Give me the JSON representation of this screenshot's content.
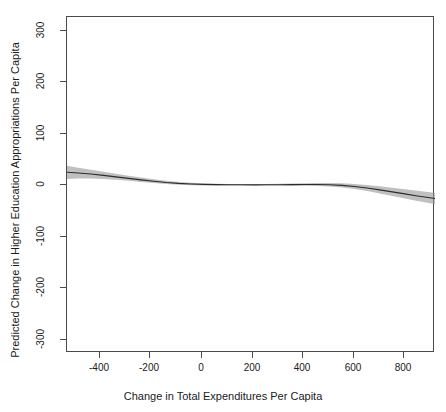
{
  "chart_data": {
    "type": "line",
    "title": "",
    "xlabel": "Change in Total Expenditures Per Capita",
    "ylabel": "Predicted Change in Higher Education Appropriations Per Capita",
    "xlim": [
      -545,
      920
    ],
    "ylim": [
      -330,
      330
    ],
    "xticks": [
      -400,
      -200,
      0,
      200,
      400,
      600,
      800
    ],
    "xtick_labels": [
      "-400",
      "-200",
      "0",
      "200",
      "400",
      "600",
      "800"
    ],
    "yticks": [
      -300,
      -200,
      -100,
      0,
      100,
      200,
      300
    ],
    "ytick_labels": [
      "-300",
      "-200",
      "-100",
      "0",
      "100",
      "200",
      "300"
    ],
    "grid": false,
    "legend": null,
    "series": [
      {
        "name": "Predicted change (fitted)",
        "type": "line",
        "color": "#2b2b2b",
        "x": [
          -545,
          -500,
          -450,
          -400,
          -350,
          -300,
          -250,
          -200,
          -150,
          -100,
          -50,
          0,
          50,
          100,
          150,
          200,
          250,
          300,
          350,
          400,
          450,
          500,
          550,
          600,
          650,
          700,
          750,
          800,
          850,
          900,
          920
        ],
        "y": [
          25,
          23.5,
          21.5,
          19,
          16,
          13,
          10,
          7.5,
          5,
          3.2,
          2,
          1.2,
          0.8,
          0.5,
          0.4,
          0.3,
          0.4,
          0.6,
          0.8,
          1.0,
          1.0,
          0.5,
          -0.8,
          -3.0,
          -6.0,
          -9.5,
          -13.5,
          -17.5,
          -21.5,
          -25.0,
          -26.5
        ]
      },
      {
        "name": "Confidence band (upper)",
        "type": "band-upper",
        "color": "#9a9a9a",
        "x": [
          -545,
          -500,
          -450,
          -400,
          -350,
          -300,
          -250,
          -200,
          -150,
          -100,
          -50,
          0,
          50,
          100,
          150,
          200,
          250,
          300,
          350,
          400,
          450,
          500,
          550,
          600,
          650,
          700,
          750,
          800,
          850,
          900,
          920
        ],
        "y": [
          38,
          34,
          30,
          26,
          22,
          18,
          14.5,
          11.5,
          8.5,
          6.0,
          4.2,
          3.0,
          2.4,
          2.0,
          1.8,
          1.8,
          2.0,
          2.4,
          3.0,
          3.6,
          4.0,
          4.0,
          3.4,
          2.0,
          0.0,
          -2.5,
          -5.5,
          -8.5,
          -11.5,
          -14.0,
          -15.0
        ]
      },
      {
        "name": "Confidence band (lower)",
        "type": "band-lower",
        "color": "#9a9a9a",
        "x": [
          -545,
          -500,
          -450,
          -400,
          -350,
          -300,
          -250,
          -200,
          -150,
          -100,
          -50,
          0,
          50,
          100,
          150,
          200,
          250,
          300,
          350,
          400,
          450,
          500,
          550,
          600,
          650,
          700,
          750,
          800,
          850,
          900,
          920
        ],
        "y": [
          12,
          13,
          13,
          12,
          10.5,
          8.5,
          6.0,
          3.8,
          1.8,
          0.4,
          -0.4,
          -0.8,
          -1.0,
          -1.2,
          -1.2,
          -1.2,
          -1.2,
          -1.2,
          -1.4,
          -1.6,
          -2.0,
          -3.0,
          -5.0,
          -8.0,
          -12.0,
          -16.5,
          -21.5,
          -26.5,
          -31.5,
          -36.0,
          -38.0
        ]
      }
    ]
  },
  "axes": {
    "x_title": "Change in Total Expenditures Per Capita",
    "y_title": "Predicted Change in Higher Education Appropriations Per Capita"
  },
  "colors": {
    "line": "#2b2b2b",
    "band": "#9a9a9a",
    "frame": "#4a4a4a",
    "background": "#ffffff",
    "text": "#1a1a1a"
  }
}
